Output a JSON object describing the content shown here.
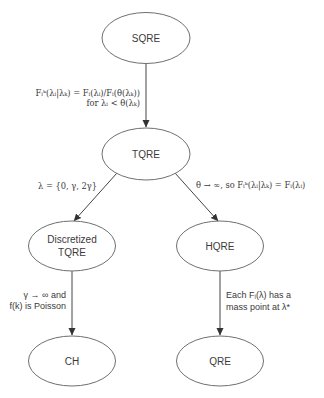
{
  "diagram": {
    "nodes": {
      "sqre": {
        "label_lines": [
          "SQRE"
        ]
      },
      "tqre": {
        "label_lines": [
          "TQRE"
        ]
      },
      "discretized_tqre": {
        "label_lines": [
          "Discretized",
          "TQRE"
        ]
      },
      "hqre": {
        "label_lines": [
          "HQRE"
        ]
      },
      "ch": {
        "label_lines": [
          "CH"
        ]
      },
      "qre": {
        "label_lines": [
          "QRE"
        ]
      }
    },
    "edges": {
      "sqre_to_tqre": {
        "from": "SQRE",
        "to": "TQRE",
        "label_lines": [
          "Fᵢᵏ(λᵢ|λₖ) = Fᵢ(λᵢ)/Fᵢ(θ(λₖ))",
          "for λᵢ < θ(λₖ)"
        ]
      },
      "tqre_to_discretized": {
        "from": "TQRE",
        "to": "Discretized TQRE",
        "label_lines": [
          "λ = {0, γ, 2γ}"
        ]
      },
      "tqre_to_hqre": {
        "from": "TQRE",
        "to": "HQRE",
        "label_lines": [
          "θ → ∞, so Fᵢᵏ(λᵢ|λₖ) = Fᵢ(λᵢ)"
        ]
      },
      "discretized_to_ch": {
        "from": "Discretized TQRE",
        "to": "CH",
        "label_lines": [
          "γ → ∞ and",
          "f(k) is Poisson"
        ]
      },
      "hqre_to_qre": {
        "from": "HQRE",
        "to": "QRE",
        "label_lines": [
          "Each Fᵢ(λ) has a",
          "mass point at λ*"
        ]
      }
    }
  }
}
